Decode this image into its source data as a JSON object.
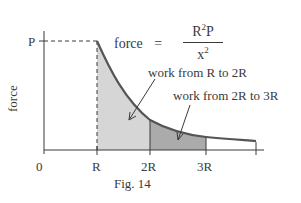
{
  "figure": {
    "caption": "Fig. 14",
    "y_axis_label": "force",
    "p_label": "P",
    "formula": {
      "lhs": "force",
      "equals": "=",
      "numerator_base": "R",
      "numerator_exp": "2",
      "numerator_tail": "P",
      "denominator_base": "x",
      "denominator_exp": "2"
    },
    "x_ticks": [
      "0",
      "R",
      "2R",
      "3R"
    ],
    "annotations": {
      "region1": "work from R to 2R",
      "region2": "work from 2R to 3R"
    },
    "colors": {
      "axis": "#3a3a3a",
      "curve": "#555555",
      "region1_fill": "#d4d4d4",
      "region2_fill": "#a9a9a9"
    }
  }
}
